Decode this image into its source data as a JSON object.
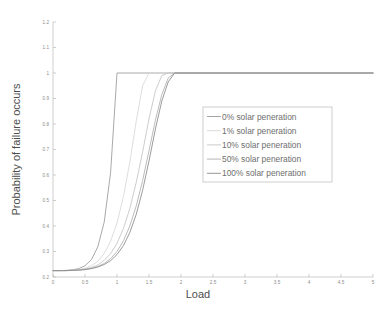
{
  "chart_data": {
    "type": "line",
    "title": "",
    "subtitle": "",
    "xlabel": "Load",
    "ylabel": "Probability of failure occurs",
    "xlim": [
      0,
      5
    ],
    "ylim": [
      0.2,
      1.2
    ],
    "grid": false,
    "legend_position": "center-right",
    "xticks": [
      "0",
      "0.5",
      "1",
      "1.5",
      "2",
      "2.5",
      "3",
      "3.5",
      "4",
      "4.5",
      "5"
    ],
    "xtick_values": [
      0,
      0.5,
      1,
      1.5,
      2,
      2.5,
      3,
      3.5,
      4,
      4.5,
      5
    ],
    "yticks": [
      "0.2",
      "0.3",
      "0.4",
      "0.5",
      "0.6",
      "0.7",
      "0.8",
      "0.9",
      "1",
      "1.1",
      "1.2"
    ],
    "ytick_values": [
      0.2,
      0.3,
      0.4,
      0.5,
      0.6,
      0.7,
      0.8,
      0.9,
      1.0,
      1.1,
      1.2
    ],
    "baseline_value": 0.225,
    "saturation_value": 1.0,
    "x": [
      0,
      0.1,
      0.2,
      0.3,
      0.4,
      0.5,
      0.6,
      0.7,
      0.8,
      0.9,
      1.0,
      1.1,
      1.2,
      1.3,
      1.4,
      1.5,
      1.6,
      1.7,
      1.8,
      1.9,
      2.0,
      2.5,
      3.0,
      3.5,
      4.0,
      4.5,
      5.0
    ],
    "series": [
      {
        "name": "0% solar peneration",
        "color": "#9a9a9a",
        "values": [
          0.225,
          0.225,
          0.226,
          0.228,
          0.233,
          0.244,
          0.268,
          0.318,
          0.415,
          0.61,
          1.0,
          1.0,
          1.0,
          1.0,
          1.0,
          1.0,
          1.0,
          1.0,
          1.0,
          1.0,
          1.0,
          1.0,
          1.0,
          1.0,
          1.0,
          1.0,
          1.0
        ]
      },
      {
        "name": "1% solar peneration",
        "color": "#d7d7d7",
        "values": [
          0.225,
          0.225,
          0.225,
          0.226,
          0.229,
          0.234,
          0.244,
          0.262,
          0.292,
          0.34,
          0.412,
          0.515,
          0.65,
          0.81,
          0.95,
          1.0,
          1.0,
          1.0,
          1.0,
          1.0,
          1.0,
          1.0,
          1.0,
          1.0,
          1.0,
          1.0,
          1.0
        ]
      },
      {
        "name": "10% solar peneration",
        "color": "#c4c4c4",
        "values": [
          0.225,
          0.225,
          0.225,
          0.226,
          0.228,
          0.231,
          0.237,
          0.247,
          0.265,
          0.292,
          0.332,
          0.39,
          0.468,
          0.57,
          0.69,
          0.82,
          0.93,
          0.99,
          1.0,
          1.0,
          1.0,
          1.0,
          1.0,
          1.0,
          1.0,
          1.0,
          1.0
        ]
      },
      {
        "name": "50% solar peneration",
        "color": "#afafaf",
        "values": [
          0.225,
          0.225,
          0.225,
          0.226,
          0.227,
          0.23,
          0.234,
          0.241,
          0.253,
          0.272,
          0.3,
          0.342,
          0.4,
          0.478,
          0.578,
          0.695,
          0.815,
          0.915,
          0.98,
          1.0,
          1.0,
          1.0,
          1.0,
          1.0,
          1.0,
          1.0,
          1.0
        ]
      },
      {
        "name": "100% solar peneration",
        "color": "#8a8a8a",
        "values": [
          0.225,
          0.225,
          0.225,
          0.226,
          0.227,
          0.229,
          0.233,
          0.239,
          0.249,
          0.264,
          0.288,
          0.323,
          0.374,
          0.445,
          0.54,
          0.655,
          0.78,
          0.89,
          0.965,
          1.0,
          1.0,
          1.0,
          1.0,
          1.0,
          1.0,
          1.0,
          1.0
        ]
      }
    ]
  },
  "legend": {
    "entries": [
      "0% solar peneration",
      "1% solar peneration",
      "10% solar peneration",
      "50% solar peneration",
      "100% solar peneration"
    ]
  }
}
